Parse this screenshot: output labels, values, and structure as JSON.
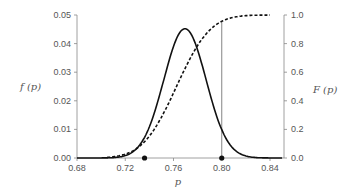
{
  "chart_data": {
    "type": "line",
    "title": "",
    "xlabel": "p",
    "ylabel_left": "f (p)",
    "ylabel_right": "F (p)",
    "xlim": [
      0.68,
      0.85
    ],
    "ylim_left": [
      0,
      0.05
    ],
    "ylim_right": [
      0,
      1.0
    ],
    "x_ticks": [
      "0.68",
      "0.72",
      "0.76",
      "0.80",
      "0.84"
    ],
    "y_ticks_left": [
      "0.00",
      "0.01",
      "0.02",
      "0.03",
      "0.04",
      "0.05"
    ],
    "y_ticks_right": [
      "0.0",
      "0.2",
      "0.4",
      "0.6",
      "0.8",
      "1.0"
    ],
    "grid": false,
    "legend": null,
    "series": [
      {
        "name": "f(p) density",
        "style": "solid",
        "axis": "left",
        "x": [
          0.68,
          0.7,
          0.71,
          0.72,
          0.73,
          0.74,
          0.75,
          0.76,
          0.765,
          0.77,
          0.775,
          0.78,
          0.79,
          0.8,
          0.81,
          0.82,
          0.83,
          0.84,
          0.85
        ],
        "values": [
          0.0,
          0.0,
          0.0005,
          0.003,
          0.01,
          0.021,
          0.033,
          0.042,
          0.0448,
          0.0452,
          0.0438,
          0.04,
          0.027,
          0.014,
          0.006,
          0.002,
          0.0005,
          0.0001,
          0.0
        ]
      },
      {
        "name": "F(p) cumulative",
        "style": "dashed",
        "axis": "right",
        "x": [
          0.7,
          0.71,
          0.72,
          0.73,
          0.74,
          0.75,
          0.76,
          0.77,
          0.78,
          0.79,
          0.8,
          0.81,
          0.82,
          0.83,
          0.84
        ],
        "values": [
          0.0,
          0.005,
          0.02,
          0.07,
          0.16,
          0.3,
          0.47,
          0.64,
          0.79,
          0.89,
          0.95,
          0.98,
          0.995,
          0.999,
          1.0
        ]
      }
    ],
    "annotations": [
      {
        "type": "point",
        "x": 0.736,
        "y": 0.0,
        "label": "marker"
      },
      {
        "type": "point",
        "x": 0.8,
        "y": 0.0,
        "label": "marker"
      },
      {
        "type": "vline",
        "x": 0.8,
        "from": 0.0,
        "to": 0.95
      }
    ]
  }
}
